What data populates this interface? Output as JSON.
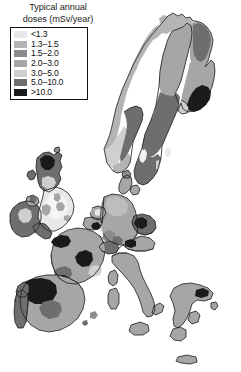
{
  "figure": {
    "name": "europe-radon-dose-map",
    "width": 241,
    "height": 372,
    "background": "#ffffff"
  },
  "legend": {
    "title_line1": "Typical annual",
    "title_line2": "doses (mSv/year)",
    "border_color": "#111111",
    "entries": [
      {
        "label": "<1.3",
        "color": "#e8e8e8",
        "min": 0.0,
        "max": 1.3
      },
      {
        "label": "1.3–1.5",
        "color": "#b4b4b4",
        "min": 1.3,
        "max": 1.5
      },
      {
        "label": "1.5–2.0",
        "color": "#8c8c8c",
        "min": 1.5,
        "max": 2.0
      },
      {
        "label": "2.0–3.0",
        "color": "#a6a6a6",
        "min": 2.0,
        "max": 3.0
      },
      {
        "label": "3.0–5.0",
        "color": "#cfcfcf",
        "min": 3.0,
        "max": 5.0
      },
      {
        "label": "5.0–10.0",
        "color": "#6e6e6e",
        "min": 5.0,
        "max": 10.0
      },
      {
        "label": ">10.0",
        "color": "#1a1a1a",
        "min": 10.0,
        "max": null
      }
    ]
  },
  "map": {
    "projection_note": "Europe, grayscale choropleth of typical annual radon dose",
    "sea_color": "#ffffff",
    "coast_stroke": "#1d1d1d",
    "border_stroke": "#2b2b2b",
    "regions": [
      {
        "name": "norway-north-coast",
        "class_index": 1
      },
      {
        "name": "norway-main",
        "class_index": 1
      },
      {
        "name": "norway-southwest",
        "class_index": 4
      },
      {
        "name": "norway-southeast",
        "class_index": 5
      },
      {
        "name": "sweden-north",
        "class_index": 3
      },
      {
        "name": "sweden-central",
        "class_index": 5
      },
      {
        "name": "sweden-south",
        "class_index": 5
      },
      {
        "name": "sweden-gotland",
        "class_index": 0
      },
      {
        "name": "finland-north",
        "class_index": 3
      },
      {
        "name": "finland-northeast",
        "class_index": 5
      },
      {
        "name": "finland-south",
        "class_index": 3
      },
      {
        "name": "finland-southeast",
        "class_index": 6
      },
      {
        "name": "denmark",
        "class_index": 3
      },
      {
        "name": "ireland",
        "class_index": 5
      },
      {
        "name": "northern-ireland",
        "class_index": 3
      },
      {
        "name": "scotland",
        "class_index": 5
      },
      {
        "name": "scotland-highlands",
        "class_index": 6
      },
      {
        "name": "england-wales",
        "class_index": 0
      },
      {
        "name": "england-southwest",
        "class_index": 5
      },
      {
        "name": "wales-patches",
        "class_index": 3
      },
      {
        "name": "netherlands",
        "class_index": 3
      },
      {
        "name": "belgium",
        "class_index": 3
      },
      {
        "name": "belgium-ardennes",
        "class_index": 6
      },
      {
        "name": "luxembourg",
        "class_index": 0
      },
      {
        "name": "germany",
        "class_index": 3
      },
      {
        "name": "germany-south-patches",
        "class_index": 5
      },
      {
        "name": "czech-republic",
        "class_index": 5
      },
      {
        "name": "czech-dark",
        "class_index": 6
      },
      {
        "name": "austria",
        "class_index": 3
      },
      {
        "name": "switzerland",
        "class_index": 5
      },
      {
        "name": "france",
        "class_index": 3
      },
      {
        "name": "france-brittany",
        "class_index": 6
      },
      {
        "name": "france-massif",
        "class_index": 6
      },
      {
        "name": "spain",
        "class_index": 3
      },
      {
        "name": "spain-galicia",
        "class_index": 6
      },
      {
        "name": "spain-northwest",
        "class_index": 5
      },
      {
        "name": "portugal",
        "class_index": 5
      },
      {
        "name": "italy",
        "class_index": 3
      },
      {
        "name": "sicily",
        "class_index": 3
      },
      {
        "name": "sardinia",
        "class_index": 3
      },
      {
        "name": "corsica",
        "class_index": 3
      },
      {
        "name": "greece",
        "class_index": 3
      },
      {
        "name": "crete",
        "class_index": 3
      },
      {
        "name": "iceland-fragment",
        "class_index": 3
      }
    ]
  }
}
